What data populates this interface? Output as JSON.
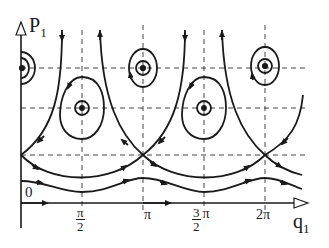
{
  "diagram": {
    "type": "phase-portrait",
    "axes": {
      "y_label_main": "P",
      "y_label_sub": "1",
      "x_label_main": "q",
      "x_label_sub": "1",
      "origin_label": "0"
    },
    "x_ticks": [
      {
        "num": "π",
        "den": "2",
        "position": 82
      },
      {
        "label": "π",
        "position": 143
      },
      {
        "coef_num": "3",
        "coef_den": "2",
        "sym": "π",
        "position": 204
      },
      {
        "label": "2π",
        "position": 265
      }
    ],
    "dashed_lines": {
      "vertical_x": [
        82,
        143,
        204,
        265
      ],
      "horizontal_y": [
        68,
        108,
        155
      ]
    },
    "centers_top": [
      [
        21,
        68
      ],
      [
        143,
        68
      ],
      [
        265,
        68
      ]
    ],
    "centers_middle": [
      [
        82,
        108
      ],
      [
        204,
        108
      ]
    ],
    "saddles": [
      [
        21,
        155
      ],
      [
        143,
        155
      ],
      [
        265,
        155
      ]
    ],
    "colors": {
      "line": "#1a1a1a",
      "dashed": "#444444",
      "background": "#ffffff"
    }
  }
}
